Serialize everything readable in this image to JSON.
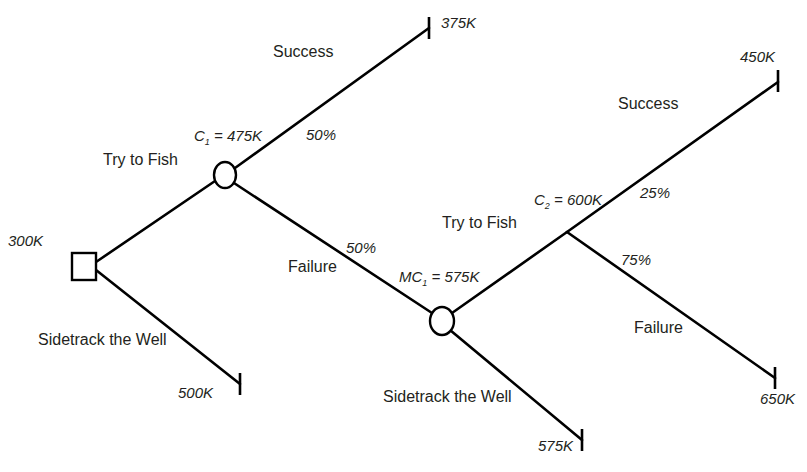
{
  "diagram": {
    "type": "decision-tree",
    "root": {
      "value": "300K",
      "shape": "square",
      "branches": {
        "try_to_fish": "Try to Fish",
        "sidetrack": "Sidetrack the Well"
      }
    },
    "sidetrack_outcome": "500K",
    "chance_node_1": {
      "label_prefix": "C",
      "label_sub": "1",
      "label_suffix": " = 475K",
      "success_label": "Success",
      "success_prob": "50%",
      "success_outcome": "375K",
      "failure_label": "Failure",
      "failure_prob": "50%"
    },
    "decision_node_2": {
      "label_prefix": "MC",
      "label_sub": "1",
      "label_suffix": " = 575K",
      "try_to_fish": "Try to Fish",
      "sidetrack": "Sidetrack the Well",
      "sidetrack_outcome": "575K"
    },
    "chance_node_2": {
      "label_prefix": "C",
      "label_sub": "2",
      "label_suffix": " = 600K",
      "success_label": "Success",
      "success_prob": "25%",
      "success_outcome": "450K",
      "failure_label": "Failure",
      "failure_prob": "75%",
      "failure_outcome": "650K"
    }
  }
}
